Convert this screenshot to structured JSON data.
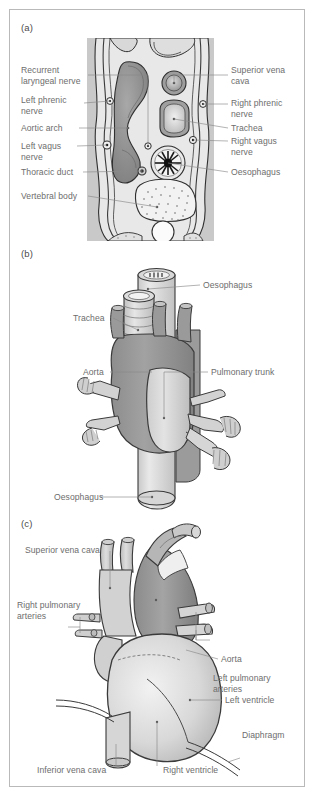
{
  "figure": {
    "panels": [
      {
        "id": "a",
        "letter": "(a)",
        "caption": "Transverse section of the thorax at the level of the aortic arch",
        "view": "axial-cross-section",
        "labels_left": [
          {
            "name": "recurrent-laryngeal-nerve",
            "text": "Recurrent\nlaryngeal nerve"
          },
          {
            "name": "left-phrenic-nerve",
            "text": "Left phrenic\nnerve"
          },
          {
            "name": "aortic-arch",
            "text": "Aortic arch"
          },
          {
            "name": "left-vagus-nerve",
            "text": "Left vagus\nnerve"
          },
          {
            "name": "thoracic-duct",
            "text": "Thoracic duct"
          },
          {
            "name": "vertebral-body",
            "text": "Vertebral body"
          }
        ],
        "labels_right": [
          {
            "name": "superior-vena-cava",
            "text": "Superior vena\ncava"
          },
          {
            "name": "right-phrenic-nerve",
            "text": "Right phrenic\nnerve"
          },
          {
            "name": "trachea",
            "text": "Trachea"
          },
          {
            "name": "right-vagus-nerve",
            "text": "Right vagus\nnerve"
          },
          {
            "name": "oesophagus",
            "text": "Oesophagus"
          }
        ]
      },
      {
        "id": "b",
        "letter": "(b)",
        "caption": "Anterior view of the great vessels, trachea and oesophagus",
        "view": "anterior-great-vessels",
        "labels": [
          {
            "name": "oesophagus-upper",
            "text": "Oesophagus"
          },
          {
            "name": "trachea",
            "text": "Trachea"
          },
          {
            "name": "aorta",
            "text": "Aorta"
          },
          {
            "name": "pulmonary-trunk",
            "text": "Pulmonary trunk"
          },
          {
            "name": "oesophagus-lower",
            "text": "Oesophagus"
          }
        ]
      },
      {
        "id": "c",
        "letter": "(c)",
        "caption": "Anterior view of the heart in situ",
        "view": "anterior-heart",
        "labels": [
          {
            "name": "superior-vena-cava",
            "text": "Superior vena cava"
          },
          {
            "name": "aorta",
            "text": "Aorta"
          },
          {
            "name": "right-pulmonary-arteries",
            "text": "Right pulmonary\narteries"
          },
          {
            "name": "left-pulmonary-arteries",
            "text": "Left pulmonary\narteries"
          },
          {
            "name": "left-ventricle",
            "text": "Left ventricle"
          },
          {
            "name": "diaphragm",
            "text": "Diaphragm"
          },
          {
            "name": "inferior-vena-cava",
            "text": "Inferior vena cava"
          },
          {
            "name": "right-ventricle",
            "text": "Right ventricle"
          }
        ]
      }
    ],
    "colors": {
      "label_text": "#6d6d6d",
      "leader_line": "#8a8a8a",
      "frame_border": "#b9b9b9",
      "background": "#ffffff",
      "body_fill": "#cfcfcf",
      "lumen_fill": "#e3e3e3",
      "vessel_dark": "#9a9a9a",
      "vessel_light": "#d5d5d5",
      "outline": "#3a3a3a"
    }
  }
}
